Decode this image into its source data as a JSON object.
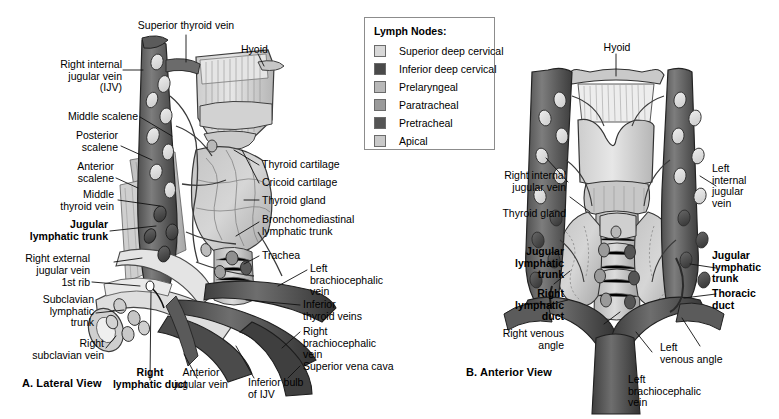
{
  "legend": {
    "title": "Lymph Nodes:",
    "items": [
      {
        "label": "Superior deep cervical",
        "color": "#d8d8d8"
      },
      {
        "label": "Inferior deep cervical",
        "color": "#4a4a4a"
      },
      {
        "label": "Prelaryngeal",
        "color": "#b8b8b8"
      },
      {
        "label": "Paratracheal",
        "color": "#9a9a9a"
      },
      {
        "label": "Pretracheal",
        "color": "#555555"
      },
      {
        "label": "Apical",
        "color": "#c9c9c9"
      }
    ]
  },
  "panel_a": {
    "title_letter": "A.",
    "title_text": "Lateral View",
    "labels": {
      "superior_thyroid_vein": "Superior thyroid vein",
      "hyoid": "Hyoid",
      "right_internal_jugular_vein": "Right internal\njugular vein\n(IJV)",
      "middle_scalene": "Middle scalene",
      "posterior_scalene": "Posterior\nscalene",
      "anterior_scalene": "Anterior\nscalene",
      "middle_thyroid_vein": "Middle\nthyroid vein",
      "jugular_lymphatic_trunk": "Jugular\nlymphatic trunk",
      "right_external_jugular_vein": "Right external\njugular vein",
      "first_rib": "1st rib",
      "subclavian_lymphatic_trunk": "Subclavian\nlymphatic\ntrunk",
      "right_subclavian_vein": "Right\nsubclavian vein",
      "right_lymphatic_duct": "Right\nlymphatic duct",
      "anterior_jugular_vein": "Anterior\njugular vein",
      "inferior_bulb_of_ijv": "Inferior bulb\nof IJV",
      "thyroid_cartilage": "Thyroid cartilage",
      "cricoid_cartilage": "Cricoid cartilage",
      "thyroid_gland": "Thyroid gland",
      "bronchomediastinal_lymphatic_trunk": "Bronchomediastinal\nlymphatic trunk",
      "trachea": "Trachea",
      "left_brachiocephalic_vein": "Left\nbrachiocephalic\nvein",
      "inferior_thyroid_veins": "Inferior\nthyroid veins",
      "right_brachiocephalic_vein": "Right\nbrachiocephalic\nvein",
      "superior_vena_cava": "Superior vena cava"
    }
  },
  "panel_b": {
    "title_letter": "B.",
    "title_text": "Anterior View",
    "labels": {
      "hyoid": "Hyoid",
      "right_internal_jugular_vein": "Right internal\njugular vein",
      "thyroid_gland": "Thyroid gland",
      "jugular_lymphatic_trunk_left_side": "Jugular\nlymphatic\ntrunk",
      "right_lymphatic_duct": "Right\nlymphatic\nduct",
      "right_venous_angle": "Right venous\nangle",
      "left_internal_jugular_vein": "Left\ninternal\njugular\nvein",
      "jugular_lymphatic_trunk_right_side": "Jugular\nlymphatic\ntrunk",
      "thoracic_duct": "Thoracic\nduct",
      "left_venous_angle": "Left\nvenous angle",
      "left_brachiocephalic_vein": "Left\nbrachiocephalic\nvein"
    }
  }
}
